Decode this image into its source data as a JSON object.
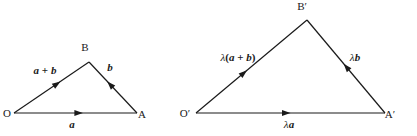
{
  "figure": {
    "background_color": "#ffffff",
    "ink_color": "#1a1a1a",
    "width": 417,
    "height": 136
  },
  "diagrams": [
    {
      "id": "triangle-left",
      "name": "original-vector-triangle",
      "vertices": [
        {
          "key": "origin",
          "label": "O",
          "x": 14,
          "y": 113,
          "label_x": 7,
          "label_y": 117
        },
        {
          "key": "a_end",
          "label": "A",
          "x": 137,
          "y": 113,
          "label_x": 142,
          "label_y": 118
        },
        {
          "key": "b_end",
          "label": "B",
          "x": 89,
          "y": 62,
          "label_x": 85,
          "label_y": 51
        }
      ],
      "edges": [
        {
          "key": "edge-a",
          "label": "a",
          "label_prefix": "",
          "from": "origin",
          "to": "a_end",
          "label_x": 72,
          "label_y": 128,
          "arrow_t": 0.56
        },
        {
          "key": "edge-a-plus-b",
          "label": "a + b",
          "label_prefix": "",
          "from": "origin",
          "to": "b_end",
          "label_x": 45,
          "label_y": 74,
          "arrow_t": 0.62
        },
        {
          "key": "edge-b",
          "label": "b",
          "label_prefix": "",
          "from": "a_end",
          "to": "b_end",
          "label_x": 110,
          "label_y": 71,
          "arrow_t": 0.62
        }
      ]
    },
    {
      "id": "triangle-right",
      "name": "scaled-vector-triangle",
      "vertices": [
        {
          "key": "origin",
          "label": "O′",
          "x": 196,
          "y": 113,
          "label_x": 185,
          "label_y": 117
        },
        {
          "key": "a_end",
          "label": "A′",
          "x": 385,
          "y": 113,
          "label_x": 390,
          "label_y": 118
        },
        {
          "key": "b_end",
          "label": "B′",
          "x": 307,
          "y": 20,
          "label_x": 302,
          "label_y": 10
        }
      ],
      "edges": [
        {
          "key": "edge-lambda-a",
          "label": "a",
          "label_prefix": "λ",
          "from": "origin",
          "to": "a_end",
          "label_x": 289,
          "label_y": 128,
          "arrow_t": 0.5
        },
        {
          "key": "edge-lambda-a-plus-b",
          "label": "(a + b)",
          "label_prefix": "λ",
          "from": "origin",
          "to": "b_end",
          "label_x": 238,
          "label_y": 61,
          "arrow_t": 0.46
        },
        {
          "key": "edge-lambda-b",
          "label": "b",
          "label_prefix": "λ",
          "from": "a_end",
          "to": "b_end",
          "label_x": 355,
          "label_y": 61,
          "arrow_t": 0.53
        }
      ]
    }
  ],
  "labels": {
    "vector_a": "a",
    "vector_b": "b",
    "vector_a_plus_b": "a + b",
    "lambda": "λ",
    "lambda_a": "λa",
    "lambda_b": "λb",
    "lambda_a_plus_b": "λ(a + b)",
    "vertex_O": "O",
    "vertex_A": "A",
    "vertex_B": "B",
    "vertex_O_prime": "O′",
    "vertex_A_prime": "A′",
    "vertex_B_prime": "B′"
  }
}
